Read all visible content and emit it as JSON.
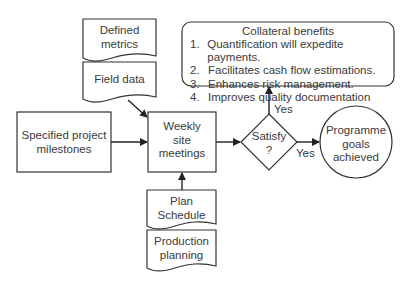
{
  "diagram": {
    "nodes": {
      "defined_metrics": {
        "label_line1": "Defined",
        "label_line2": "metrics",
        "shape": "document"
      },
      "field_data": {
        "label": "Field data",
        "shape": "document"
      },
      "specified_milestones": {
        "label_line1": "Specified project",
        "label_line2": "milestones",
        "shape": "rectangle"
      },
      "weekly_meetings": {
        "label_line1": "Weekly",
        "label_line2": "site",
        "label_line3": "meetings",
        "shape": "rectangle"
      },
      "plan_schedule": {
        "label_line1": "Plan",
        "label_line2": "Schedule",
        "shape": "document"
      },
      "production_planning": {
        "label_line1": "Production",
        "label_line2": "planning",
        "shape": "document"
      },
      "satisfy": {
        "label_line1": "Satisfy",
        "label_line2": "?",
        "shape": "diamond"
      },
      "programme_goals": {
        "label_line1": "Programme",
        "label_line2": "goals",
        "label_line3": "achieved",
        "shape": "circle"
      },
      "collateral_benefits": {
        "title": "Collateral benefits",
        "shape": "rounded-rectangle",
        "items": [
          {
            "num": "1.",
            "text": "Quantification will expedite payments."
          },
          {
            "num": "2.",
            "text": "Facilitates cash flow estimations."
          },
          {
            "num": "3.",
            "text": "Enhances risk management."
          },
          {
            "num": "4.",
            "text": "Improves quality documentation"
          }
        ]
      }
    },
    "edges": [
      {
        "from": "field_data",
        "to": "weekly_meetings",
        "label": ""
      },
      {
        "from": "specified_milestones",
        "to": "weekly_meetings",
        "label": ""
      },
      {
        "from": "plan_schedule",
        "to": "weekly_meetings",
        "label": ""
      },
      {
        "from": "weekly_meetings",
        "to": "satisfy",
        "label": ""
      },
      {
        "from": "satisfy",
        "to": "collateral_benefits",
        "label": "Yes"
      },
      {
        "from": "satisfy",
        "to": "programme_goals",
        "label": "Yes"
      }
    ],
    "edge_labels": {
      "yes_up": "Yes",
      "yes_right": "Yes"
    }
  }
}
